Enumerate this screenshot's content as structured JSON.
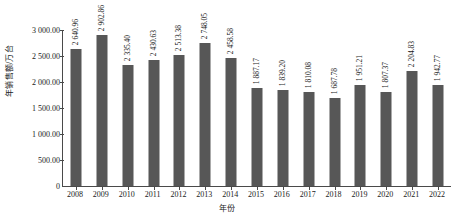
{
  "chart_data": {
    "type": "bar",
    "title": "",
    "xlabel": "年份",
    "ylabel": "年销售额/万台",
    "categories": [
      "2008",
      "2009",
      "2010",
      "2011",
      "2012",
      "2013",
      "2014",
      "2015",
      "2016",
      "2017",
      "2018",
      "2019",
      "2020",
      "2021",
      "2022"
    ],
    "values": [
      2640.96,
      2902.86,
      2335.4,
      2430.63,
      2513.38,
      2748.05,
      2458.58,
      1887.17,
      1839.2,
      1810.08,
      1687.78,
      1951.21,
      1807.37,
      2204.83,
      1942.77
    ],
    "value_labels": [
      "2 640.96",
      "2 902.86",
      "2 335.40",
      "2 430.63",
      "2 513.38",
      "2 748.05",
      "2 458.58",
      "1 887.17",
      "1 839.20",
      "1 810.08",
      "1 687.78",
      "1 951.21",
      "1 807.37",
      "2 204.83",
      "1 942.77"
    ],
    "ylim": [
      0,
      3000
    ],
    "yticks": [
      0,
      500,
      1000,
      1500,
      2000,
      2500,
      3000
    ],
    "ytick_labels": [
      "0",
      "500.00",
      "1 000.00",
      "1 500.00",
      "2 000.00",
      "2 500.00",
      "3 000.00"
    ],
    "grid": false,
    "legend": "none",
    "bar_color": "#575757",
    "axis_color": "#4a4a4a",
    "text_color": "#1a1a1a"
  }
}
